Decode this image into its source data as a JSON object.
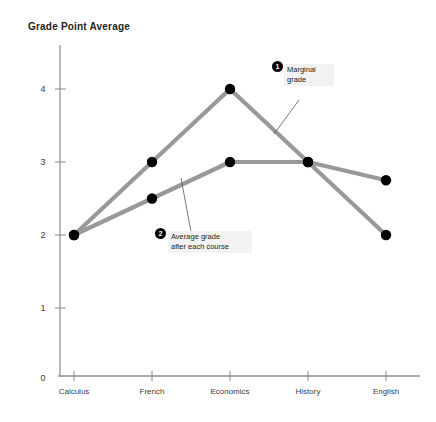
{
  "chart_data": {
    "type": "line",
    "title": "Grade Point Average",
    "xlabel": "",
    "ylabel": "Grade Point Average",
    "categories": [
      "Calculus",
      "French",
      "Economics",
      "History",
      "English"
    ],
    "ylim": [
      0,
      4.4
    ],
    "yticks": [
      "0",
      "1",
      "2",
      "3",
      "4"
    ],
    "ytick_values": [
      0,
      1,
      2,
      3,
      4
    ],
    "grid": false,
    "legend_position": "inline-annotations",
    "line_color": "#999999",
    "marker_color": "#000000",
    "series": [
      {
        "name": "Marginal grade",
        "values": [
          2,
          3,
          4,
          3,
          2
        ]
      },
      {
        "name": "Average grade after each course",
        "values": [
          2,
          2.5,
          3,
          3,
          2.75
        ]
      }
    ],
    "annotations": [
      {
        "number": "1",
        "text": "Marginal\ngrade",
        "target_series": "Marginal grade"
      },
      {
        "number": "2",
        "text": "Average grade\nafter each course",
        "target_series": "Average grade after each course"
      }
    ]
  }
}
